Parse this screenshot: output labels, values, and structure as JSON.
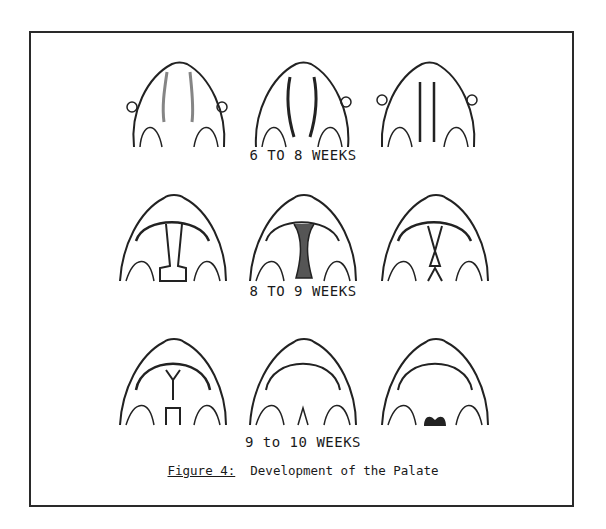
{
  "figure": {
    "caption_label": "Figure 4:",
    "caption_text": "Development of the Palate"
  },
  "rows": [
    {
      "label": "6 TO 8 WEEKS",
      "stages": [
        "early-a",
        "early-b",
        "early-c"
      ]
    },
    {
      "label": "8 TO 9 WEEKS",
      "stages": [
        "mid-a",
        "mid-b",
        "mid-c"
      ]
    },
    {
      "label": "9 to 10 WEEKS",
      "stages": [
        "late-a",
        "late-b",
        "late-c"
      ]
    }
  ],
  "colors": {
    "ink": "#1a1a1a",
    "background": "#ffffff"
  }
}
